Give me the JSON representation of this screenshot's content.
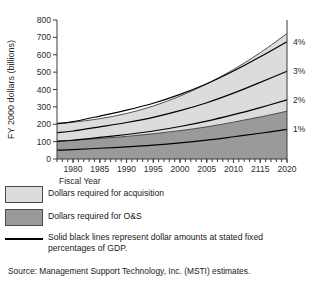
{
  "chart_data": {
    "type": "area",
    "title": "",
    "xlabel": "Fiscal Year",
    "ylabel": "FY 2000 dollars (billions)",
    "xlim": [
      1977,
      2020
    ],
    "ylim": [
      0,
      800
    ],
    "yticks": [
      0,
      100,
      200,
      300,
      400,
      500,
      600,
      700,
      800
    ],
    "xticks": [
      1980,
      1985,
      1990,
      1995,
      2000,
      2005,
      2010,
      2115,
      2020
    ],
    "xtick_positions": [
      1980,
      1985,
      1990,
      1995,
      2000,
      2005,
      2010,
      2015,
      2020
    ],
    "grid": false,
    "legend_position": "below",
    "x": [
      1977,
      1980,
      1985,
      1990,
      1995,
      2000,
      2005,
      2010,
      2015,
      2020
    ],
    "series": [
      {
        "name": "Dollars required for O&S",
        "kind": "stacked-area",
        "values": [
          103,
          108,
          118,
          130,
          145,
          163,
          185,
          212,
          242,
          275
        ]
      },
      {
        "name": "Dollars required for acquisition",
        "kind": "stacked-area",
        "cumulative_top": [
          205,
          212,
          232,
          262,
          305,
          362,
          432,
          515,
          612,
          722
        ]
      },
      {
        "name": "1%",
        "kind": "gdp-line",
        "values": [
          51,
          54,
          62,
          70,
          80,
          93,
          109,
          128,
          148,
          170
        ]
      },
      {
        "name": "2%",
        "kind": "gdp-line",
        "values": [
          102,
          108,
          124,
          141,
          161,
          187,
          218,
          255,
          296,
          340
        ]
      },
      {
        "name": "3%",
        "kind": "gdp-line",
        "values": [
          152,
          161,
          185,
          210,
          240,
          278,
          324,
          379,
          441,
          505
        ]
      },
      {
        "name": "4%",
        "kind": "gdp-line",
        "values": [
          203,
          215,
          247,
          281,
          321,
          372,
          433,
          506,
          588,
          675
        ]
      }
    ],
    "right_labels": [
      {
        "text": "4%",
        "value": 675
      },
      {
        "text": "3%",
        "value": 505
      },
      {
        "text": "2%",
        "value": 340
      },
      {
        "text": "1%",
        "value": 170
      }
    ],
    "colors": {
      "acquisition_fill": "#dcdcdc",
      "os_fill": "#9a9a9a",
      "line": "#000000",
      "axis": "#3a3a3a",
      "text": "#1a1a1a",
      "background": "#ffffff"
    }
  },
  "legend": {
    "items": [
      {
        "type": "swatch",
        "swatch_color": "#dcdcdc",
        "label": "Dollars required for acquisition"
      },
      {
        "type": "swatch",
        "swatch_color": "#9a9a9a",
        "label": "Dollars required for O&S"
      },
      {
        "type": "line",
        "label_line1": "Solid black lines represent dollar amounts at stated fixed",
        "label_line2": "percentages of GDP."
      }
    ]
  },
  "source": {
    "text": "Source: Management Support Technology, Inc. (MSTI) estimates."
  }
}
